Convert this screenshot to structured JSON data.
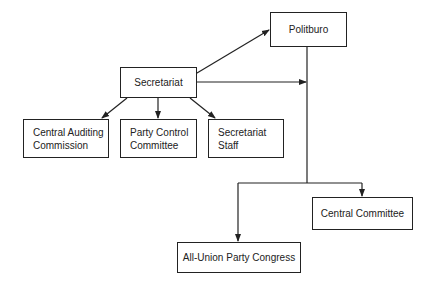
{
  "diagram": {
    "nodes": [
      {
        "id": "politburo",
        "label": "Politburo"
      },
      {
        "id": "secretariat",
        "label": "Secretariat"
      },
      {
        "id": "central_auditing",
        "label_line1": "Central Auditing",
        "label_line2": "Commission"
      },
      {
        "id": "party_control",
        "label_line1": "Party Control",
        "label_line2": "Committee"
      },
      {
        "id": "secretariat_staff",
        "label_line1": "Secretariat",
        "label_line2": "Staff"
      },
      {
        "id": "central_committee",
        "label": "Central Committee"
      },
      {
        "id": "all_union",
        "label": "All-Union Party Congress"
      }
    ],
    "edges": [
      {
        "from": "politburo",
        "to": "secretariat",
        "bidirectional": true
      },
      {
        "from": "secretariat",
        "to": "politburo-line"
      },
      {
        "from": "secretariat",
        "to": "central_auditing"
      },
      {
        "from": "secretariat",
        "to": "party_control"
      },
      {
        "from": "secretariat",
        "to": "secretariat_staff"
      },
      {
        "from": "politburo",
        "to": "central_committee"
      },
      {
        "from": "politburo",
        "to": "all_union"
      }
    ]
  }
}
